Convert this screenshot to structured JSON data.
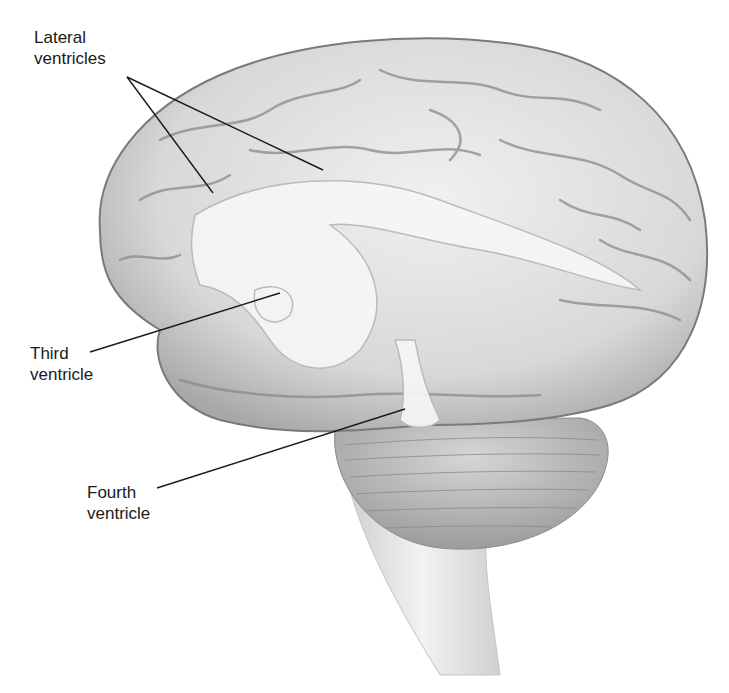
{
  "diagram": {
    "labels": [
      {
        "id": "lateral",
        "line1": "Lateral",
        "line2": "ventricles"
      },
      {
        "id": "third",
        "line1": "Third",
        "line2": "ventricle"
      },
      {
        "id": "fourth",
        "line1": "Fourth",
        "line2": "ventricle"
      }
    ],
    "colors": {
      "background": "#ffffff",
      "brain_fill": "#e2e2e2",
      "brain_shadow": "#9a9a9a",
      "ventricle_fill": "#f4f4f4",
      "leader_line": "#1a1a1a"
    }
  }
}
